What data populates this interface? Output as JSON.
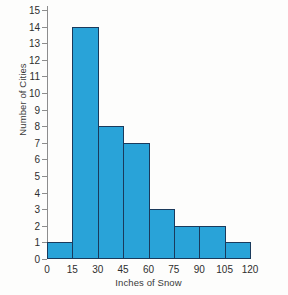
{
  "chart_data": {
    "type": "bar",
    "subtype": "histogram",
    "title": "",
    "xlabel": "Inches of Snow",
    "ylabel": "Number of Cities",
    "grid": false,
    "legend": false,
    "bin_width": 15,
    "bin_edges": [
      0,
      15,
      30,
      45,
      60,
      75,
      90,
      105,
      120
    ],
    "categories": [
      "0-15",
      "15-30",
      "30-45",
      "45-60",
      "60-75",
      "75-90",
      "90-105",
      "105-120"
    ],
    "values": [
      1,
      14,
      8,
      7,
      3,
      2,
      2,
      1
    ],
    "xtick_labels": [
      "0",
      "15",
      "30",
      "45",
      "60",
      "75",
      "90",
      "105",
      "120"
    ],
    "xlim": [
      0,
      120
    ],
    "ytick_labels": [
      "0",
      "1",
      "2",
      "3",
      "4",
      "5",
      "6",
      "7",
      "8",
      "9",
      "10",
      "11",
      "12",
      "13",
      "14",
      "15"
    ],
    "ylim": [
      0,
      15
    ],
    "bar_fill_color": "#29a3d8",
    "bar_edge_color": "#1a3a5c",
    "axis_color": "#8d8d8d",
    "background_color": "#fdfdfc"
  }
}
